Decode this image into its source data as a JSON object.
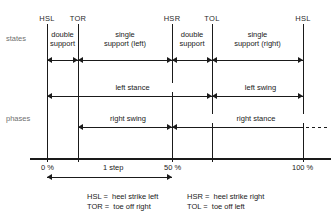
{
  "diagram": {
    "row_labels": {
      "states": "states",
      "phases": "phases"
    },
    "events": [
      {
        "key": "hsl_start",
        "label": "HSL",
        "x_pct": 0
      },
      {
        "key": "tor",
        "label": "TOR",
        "x_pct": 12
      },
      {
        "key": "hsr",
        "label": "HSR",
        "x_pct": 50
      },
      {
        "key": "tol",
        "label": "TOL",
        "x_pct": 62
      },
      {
        "key": "hsl_end",
        "label": "HSL",
        "x_pct": 100
      }
    ],
    "states": [
      {
        "key": "double-support-1",
        "line1": "double",
        "line2": "support",
        "from": "hsl_start",
        "to": "tor"
      },
      {
        "key": "single-support-left",
        "line1": "single",
        "line2": "support  (left)",
        "from": "tor",
        "to": "hsr"
      },
      {
        "key": "double-support-2",
        "line1": "double",
        "line2": "support",
        "from": "hsr",
        "to": "tol"
      },
      {
        "key": "single-support-right",
        "line1": "single",
        "line2": "support  (right)",
        "from": "tol",
        "to": "hsl_end"
      }
    ],
    "phases_upper": [
      {
        "key": "left-stance",
        "label": "left stance",
        "from": "hsl_start",
        "to": "tol"
      },
      {
        "key": "left-swing",
        "label": "left swing",
        "from": "tol",
        "to": "hsl_end"
      }
    ],
    "phases_lower": [
      {
        "key": "right-swing",
        "label": "right swing",
        "from": "tor",
        "to": "hsr"
      },
      {
        "key": "right-stance",
        "label": "right stance",
        "from": "hsr",
        "to": "hsl_end",
        "continues": true
      }
    ],
    "axis": {
      "ticks": [
        {
          "key": "pct-0",
          "label": "0 %",
          "x_pct": 0
        },
        {
          "key": "pct-50",
          "label": "50 %",
          "x_pct": 50
        },
        {
          "key": "pct-100",
          "label": "100 %",
          "x_pct": 100
        }
      ],
      "measure": {
        "key": "one-step",
        "label": "1 step",
        "from_pct": 0,
        "to_pct": 50
      }
    },
    "legend": [
      {
        "abbr": "HSL",
        "eq": "=",
        "meaning": "heel strike left"
      },
      {
        "abbr": "TOR",
        "eq": "=",
        "meaning": "toe off right"
      },
      {
        "abbr": "HSR",
        "eq": "=",
        "meaning": "heel strike right"
      },
      {
        "abbr": "TOL",
        "eq": "=",
        "meaning": "toe off left"
      }
    ],
    "colors": {
      "ink": "#1a1a1a",
      "muted": "#6f6f6f",
      "background": "#ffffff"
    }
  }
}
